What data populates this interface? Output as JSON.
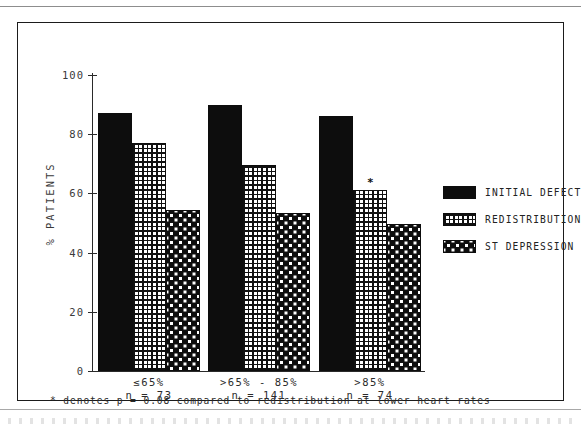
{
  "figure": {
    "ylabel": "% PATIENTS",
    "footnote": "* denotes p = 0.08 compared to redistribution at lower heart rates",
    "significance_marker": "*"
  },
  "axis": {
    "yticks": [
      "100",
      "80",
      "60",
      "40",
      "20",
      "0"
    ],
    "ytick_values": [
      100,
      80,
      60,
      40,
      20,
      0
    ]
  },
  "groups": [
    {
      "label": "≤65%",
      "n_text": "n = 73"
    },
    {
      "label": ">65% - 85%",
      "n_text": "n = 141"
    },
    {
      "label": ">85%",
      "n_text": "n = 74"
    }
  ],
  "legend": {
    "items": [
      {
        "label": "INITIAL DEFECT",
        "pattern": "solid-black"
      },
      {
        "label": "REDISTRIBUTION",
        "pattern": "fine-grid"
      },
      {
        "label": "ST DEPRESSION",
        "pattern": "checker-dots"
      }
    ]
  },
  "colors": {
    "ink": "#0d0d0d",
    "paper": "#ffffff",
    "axis": "#2a2a2a",
    "text": "#2b2b2b"
  },
  "chart_data": {
    "type": "bar",
    "title": "",
    "xlabel": "",
    "ylabel": "% PATIENTS",
    "ylim": [
      0,
      100
    ],
    "yticks": [
      0,
      20,
      40,
      60,
      80,
      100
    ],
    "grid": false,
    "legend_position": "right",
    "categories": [
      "≤65%",
      ">65% - 85%",
      ">85%"
    ],
    "group_n": [
      73,
      141,
      74
    ],
    "series": [
      {
        "name": "INITIAL DEFECT",
        "values": [
          87,
          90,
          86
        ]
      },
      {
        "name": "REDISTRIBUTION",
        "values": [
          77,
          69.5,
          61
        ]
      },
      {
        "name": "ST DEPRESSION",
        "values": [
          54.5,
          53.5,
          49.5
        ]
      }
    ],
    "annotations": [
      {
        "text": "*",
        "series": "REDISTRIBUTION",
        "category": ">85%",
        "value": 61
      }
    ],
    "footnote": "* denotes p = 0.08 compared to redistribution at lower heart rates"
  }
}
